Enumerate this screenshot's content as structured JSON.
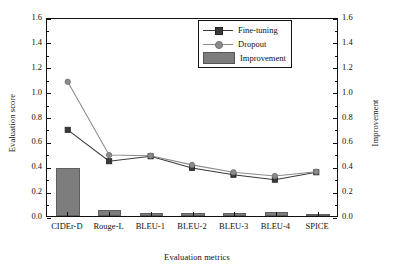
{
  "chart_data": {
    "type": "bar",
    "title": "",
    "xlabel": "Evaluation metrics",
    "ylabel": "Evaluation score",
    "y2label": "Improvement",
    "ylim": [
      0.0,
      1.6
    ],
    "y2lim": [
      0.0,
      1.6
    ],
    "grid": false,
    "legend_position": "top-right inside",
    "categories": [
      "CIDEr-D",
      "Rouge-L",
      "BLEU-1",
      "BLEU-2",
      "BLEU-3",
      "BLEU-4",
      "SPICE"
    ],
    "yticks": [
      "0.0",
      "0.2",
      "0.4",
      "0.6",
      "0.8",
      "1.0",
      "1.2",
      "1.4",
      "1.6"
    ],
    "y2ticks": [
      "0.0",
      "0.2",
      "0.4",
      "0.6",
      "0.8",
      "1.0",
      "1.2",
      "1.4",
      "1.6"
    ],
    "series": [
      {
        "name": "Fine-tuning",
        "marker": "square",
        "axis": "left",
        "color": "#3a3a3a",
        "values": [
          0.7,
          0.445,
          0.485,
          0.39,
          0.335,
          0.295,
          0.355
        ]
      },
      {
        "name": "Dropout",
        "marker": "circle",
        "axis": "left",
        "color": "#8c8c8c",
        "values": [
          1.09,
          0.495,
          0.49,
          0.415,
          0.355,
          0.325,
          0.36
        ]
      },
      {
        "name": "Improvement",
        "marker": "bar",
        "axis": "right",
        "color": "#7d7d7d",
        "values": [
          0.39,
          0.05,
          0.025,
          0.025,
          0.025,
          0.03,
          0.015
        ]
      }
    ]
  },
  "legend": {
    "items": [
      {
        "label": "Fine-tuning",
        "key": "line-square-marker"
      },
      {
        "label": "Dropout",
        "key": "line-circle-marker"
      },
      {
        "label": "Improvement",
        "key": "bar-patch"
      }
    ]
  },
  "colors": {
    "fine_tuning": "#3a3a3a",
    "dropout": "#8c8c8c",
    "improvement_bar": "#7d7d7d",
    "axis": "#111111",
    "background": "#ffffff"
  }
}
